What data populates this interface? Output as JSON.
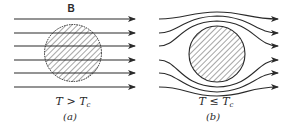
{
  "figure": {
    "field_label": "B",
    "panels": [
      {
        "id": "a",
        "tag": "(a)",
        "condition": {
          "lhs": "T",
          "op": ">",
          "rhs": "T",
          "sub": "c"
        },
        "description": "Magnetic field lines pass straight through the sample (normal state)"
      },
      {
        "id": "b",
        "tag": "(b)",
        "condition": {
          "lhs": "T",
          "op": "≤",
          "rhs": "T",
          "sub": "c"
        },
        "description": "Magnetic field lines are expelled and bend around the sample (Meissner effect)"
      }
    ],
    "colors": {
      "line": "#2a2a2a",
      "hatch": "#3a3a3a",
      "background": "#ffffff"
    }
  }
}
